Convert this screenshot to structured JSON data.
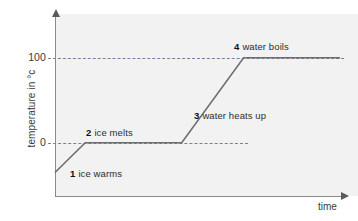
{
  "chart_data": {
    "type": "line",
    "title": "",
    "subtitle": "",
    "xlabel": "time",
    "ylabel": "temperature in °c",
    "ytick_labels": [
      "100",
      "0"
    ],
    "ytick_values": [
      100,
      0
    ],
    "xtick_labels": [],
    "xlim": [
      0,
      100
    ],
    "ylim": [
      -40,
      160
    ],
    "grid": "horizontal dashed gridlines at 0 and 100",
    "legend_position": "none",
    "x": [
      0,
      10.5,
      44,
      65.5,
      99
    ],
    "y": [
      -35,
      0,
      0,
      100,
      100
    ],
    "series": [
      {
        "name": "heating curve of water",
        "color": "#6e6e6e",
        "points": [
          {
            "x": 0,
            "y": -35
          },
          {
            "x": 10.5,
            "y": 0
          },
          {
            "x": 44,
            "y": 0
          },
          {
            "x": 65.5,
            "y": 100
          },
          {
            "x": 99,
            "y": 100
          }
        ]
      }
    ],
    "annotations": [
      {
        "num": "1",
        "label": "ice warms",
        "segment": "rising from below 0 °c to 0 °c"
      },
      {
        "num": "2",
        "label": "ice melts",
        "segment": "plateau at 0 °c"
      },
      {
        "num": "3",
        "label": "water heats up",
        "segment": "rising from 0 °c to 100 °c"
      },
      {
        "num": "4",
        "label": "water boils",
        "segment": "plateau at 100 °c"
      }
    ]
  },
  "axes": {
    "y_title": "temperature in °c",
    "x_title": "time",
    "tick_100": "100",
    "tick_0": "0"
  },
  "annotations": {
    "one": {
      "num": "1",
      "text": "ice warms"
    },
    "two": {
      "num": "2",
      "text": "ice melts"
    },
    "three": {
      "num": "3",
      "text": "water heats up"
    },
    "four": {
      "num": "4",
      "text": "water boils"
    }
  },
  "colors": {
    "panel": "#f2f2f2",
    "axis": "#8a8a8a",
    "curve": "#6e6e6e",
    "gridline": "#7d7d9a",
    "text": "#3a3a3a"
  }
}
